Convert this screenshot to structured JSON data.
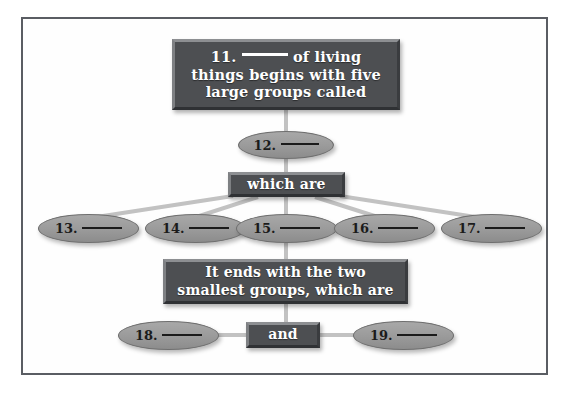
{
  "diagram": {
    "title_box": {
      "line1_pre": "11.",
      "line1_post": "of living",
      "line2": "things begins with five",
      "line3": "large groups called"
    },
    "node_12": {
      "number": "12.",
      "blank": ""
    },
    "which_are_box": {
      "label": "which are"
    },
    "branch_ovals": [
      {
        "number": "13.",
        "blank": ""
      },
      {
        "number": "14.",
        "blank": ""
      },
      {
        "number": "15.",
        "blank": ""
      },
      {
        "number": "16.",
        "blank": ""
      },
      {
        "number": "17.",
        "blank": ""
      }
    ],
    "ends_box": {
      "line1": "It ends with the two",
      "line2": "smallest groups, which are"
    },
    "and_box": {
      "label": "and"
    },
    "bottom_ovals": [
      {
        "number": "18.",
        "blank": ""
      },
      {
        "number": "19.",
        "blank": ""
      }
    ],
    "colors": {
      "box_fill": "#4d4f52",
      "box_text": "#ffffff",
      "oval_fill": "#9b9b9b",
      "oval_text": "#1b1b1b",
      "connector": "#c2c2c2",
      "frame_border": "#5a5d63",
      "page_background": "#ffffff"
    }
  }
}
